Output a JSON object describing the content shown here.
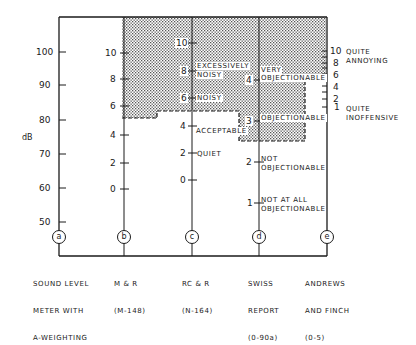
{
  "diagram": {
    "y_unit_label": "dB",
    "colors": {
      "line": "#1a1a1a",
      "shade": "#b8b8b8",
      "background": "#ffffff"
    },
    "axes": [
      {
        "id": "a",
        "name_lines": [
          "SOUND LEVEL",
          "METER WITH",
          "A-WEIGHTING"
        ],
        "ticks": [
          "100",
          "90",
          "80",
          "70",
          "60",
          "50"
        ]
      },
      {
        "id": "b",
        "name_lines": [
          "M & R",
          "(M-148)"
        ],
        "ticks": [
          "10",
          "8",
          "6",
          "4",
          "2",
          "0"
        ]
      },
      {
        "id": "c",
        "name_lines": [
          "RC & R",
          "(N-164)"
        ],
        "ticks": [
          "10",
          "8",
          "6",
          "4",
          "2",
          "0"
        ],
        "annotations": [
          "EXCESSIVELY",
          "NOISY",
          "NOISY",
          "ACCEPTABLE",
          "QUIET"
        ]
      },
      {
        "id": "d",
        "name_lines": [
          "SWISS",
          "REPORT",
          "(0-90a)"
        ],
        "ticks": [
          "4",
          "3",
          "2",
          "1"
        ],
        "annotations": [
          "VERY",
          "OBJECTIONABLE",
          "OBJECTIONABLE",
          "NOT",
          "OBJECTIONABLE",
          "NOT AT ALL",
          "OBJECTIONABLE"
        ]
      },
      {
        "id": "e",
        "name_lines": [
          "ANDREWS",
          "AND FINCH",
          "(0-5)"
        ],
        "ticks": [
          "10",
          "8",
          "6",
          "4",
          "2",
          "1"
        ],
        "annotations": [
          "QUITE",
          "ANNOYING",
          "QUITE",
          "INOFFENSIVE"
        ]
      }
    ]
  }
}
